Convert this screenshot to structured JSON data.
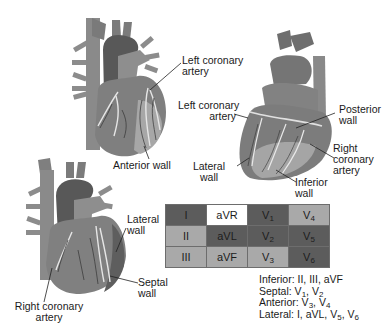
{
  "diagram": {
    "type": "Coronary anatomy and ECG lead territories",
    "hearts": [
      {
        "id": "heart-anterior-view",
        "labels": [
          "Left coronary artery",
          "Anterior wall"
        ]
      },
      {
        "id": "heart-posterior-view",
        "labels": [
          "Left coronary artery",
          "Posterior wall",
          "Right coronary artery",
          "Inferior wall",
          "Lateral wall"
        ]
      },
      {
        "id": "heart-septal-view",
        "labels": [
          "Lateral wall",
          "Septal wall",
          "Right coronary artery"
        ]
      }
    ],
    "labels": {
      "top_left_lca_1": "Left coronary",
      "top_left_lca_2": "artery",
      "anterior_wall": "Anterior wall",
      "right_lca_1": "Left coronary",
      "right_lca_2": "artery",
      "posterior_1": "Posterior",
      "posterior_2": "wall",
      "rca_1": "Right",
      "rca_2": "coronary",
      "rca_3": "artery",
      "lateral_1": "Lateral",
      "lateral_2": "wall",
      "inferior_1": "Inferior",
      "inferior_2": "wall",
      "bl_lateral_1": "Lateral",
      "bl_lateral_2": "wall",
      "septal_1": "Septal",
      "septal_2": "wall",
      "bl_rca_1": "Right coronary",
      "bl_rca_2": "artery"
    },
    "lead_table": {
      "rows": [
        [
          {
            "text": "I",
            "shade": "dark"
          },
          {
            "text": "aVR",
            "shade": "white"
          },
          {
            "text": "V",
            "sub": "1",
            "shade": "dark"
          },
          {
            "text": "V",
            "sub": "4",
            "shade": "light"
          }
        ],
        [
          {
            "text": "II",
            "shade": "light"
          },
          {
            "text": "aVL",
            "shade": "dark"
          },
          {
            "text": "V",
            "sub": "2",
            "shade": "dark"
          },
          {
            "text": "V",
            "sub": "5",
            "shade": "dark"
          }
        ],
        [
          {
            "text": "III",
            "shade": "light"
          },
          {
            "text": "aVF",
            "shade": "light"
          },
          {
            "text": "V",
            "sub": "3",
            "shade": "light"
          },
          {
            "text": "V",
            "sub": "6",
            "shade": "dark"
          }
        ]
      ]
    },
    "legend": {
      "inferior": "Inferior: II, III, aVF",
      "septal_prefix": "Septal: ",
      "anterior_prefix": "Anterior: ",
      "lateral_prefix": "Lateral: I, aVL, "
    },
    "colors": {
      "dark_cell": "#5c5c5c",
      "light_cell": "#a9a9a9",
      "white_cell": "#ffffff",
      "heart_dark": "#5a5a5a",
      "heart_mid": "#808080",
      "heart_light": "#a8a8a8"
    }
  }
}
